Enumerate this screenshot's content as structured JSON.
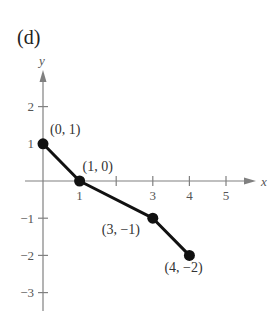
{
  "panel_label": "(d)",
  "colors": {
    "axis": "#808080",
    "line": "#111111",
    "point": "#111111",
    "text": "#333333"
  },
  "chart_data": {
    "type": "line",
    "title": "(d)",
    "xlabel": "x",
    "ylabel": "y",
    "x": [
      0,
      1,
      3,
      4
    ],
    "series": [
      {
        "name": "polyline",
        "values": [
          1,
          0,
          -1,
          -2
        ]
      }
    ],
    "points": [
      {
        "x": 0,
        "y": 1,
        "label": "(0, 1)"
      },
      {
        "x": 1,
        "y": 0,
        "label": "(1, 0)"
      },
      {
        "x": 3,
        "y": -1,
        "label": "(3, −1)"
      },
      {
        "x": 4,
        "y": -2,
        "label": "(4, −2)"
      }
    ],
    "x_ticks": [
      1,
      2,
      3,
      4,
      5
    ],
    "x_tick_labels": [
      "1",
      "",
      "3",
      "4",
      "5"
    ],
    "y_ticks": [
      2,
      1,
      -1,
      -2,
      -3
    ],
    "y_tick_labels": [
      "2",
      "1",
      "−1",
      "−2",
      "−3"
    ],
    "xlim": [
      -0.5,
      5.8
    ],
    "ylim": [
      -3.5,
      3
    ],
    "grid": false,
    "legend": null
  }
}
